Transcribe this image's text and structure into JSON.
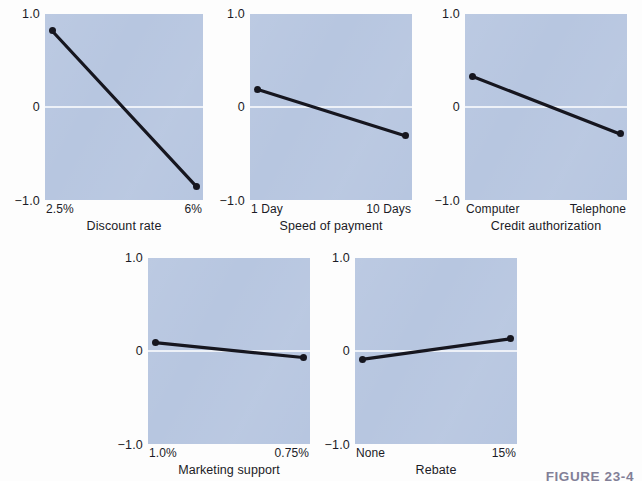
{
  "figure": {
    "caption": "FIGURE 23-4",
    "background_color": "#fdfdfd",
    "panel_fill_color": "#b7c6e0",
    "line_color": "#16161f",
    "zero_line_color": "#ffffff"
  },
  "axis": {
    "y_top_label": "1.0",
    "y_zero_label": "0",
    "y_bottom_label": "−1.0",
    "y_min": -1.0,
    "y_max": 1.0
  },
  "chart_data": [
    {
      "type": "line",
      "title": "",
      "xlabel": "Discount rate",
      "ylabel": "",
      "categories": [
        "2.5%",
        "6%"
      ],
      "values": [
        0.82,
        -0.85
      ],
      "ylim": [
        -1.0,
        1.0
      ],
      "grid": false,
      "legend": "none",
      "zero_line": true
    },
    {
      "type": "line",
      "title": "",
      "xlabel": "Speed of payment",
      "ylabel": "",
      "categories": [
        "1 Day",
        "10 Days"
      ],
      "values": [
        0.19,
        -0.31
      ],
      "ylim": [
        -1.0,
        1.0
      ],
      "grid": false,
      "legend": "none",
      "zero_line": true
    },
    {
      "type": "line",
      "title": "",
      "xlabel": "Credit authorization",
      "ylabel": "",
      "categories": [
        "Computer",
        "Telephone"
      ],
      "values": [
        0.33,
        -0.29
      ],
      "ylim": [
        -1.0,
        1.0
      ],
      "grid": false,
      "legend": "none",
      "zero_line": true
    },
    {
      "type": "line",
      "title": "",
      "xlabel": "Marketing support",
      "ylabel": "",
      "categories": [
        "1.0%",
        "0.75%"
      ],
      "values": [
        0.09,
        -0.07
      ],
      "ylim": [
        -1.0,
        1.0
      ],
      "grid": false,
      "legend": "none",
      "zero_line": true
    },
    {
      "type": "line",
      "title": "",
      "xlabel": "Rebate",
      "ylabel": "",
      "categories": [
        "None",
        "15%"
      ],
      "values": [
        -0.09,
        0.13
      ],
      "ylim": [
        -1.0,
        1.0
      ],
      "grid": false,
      "legend": "none",
      "zero_line": true
    }
  ]
}
